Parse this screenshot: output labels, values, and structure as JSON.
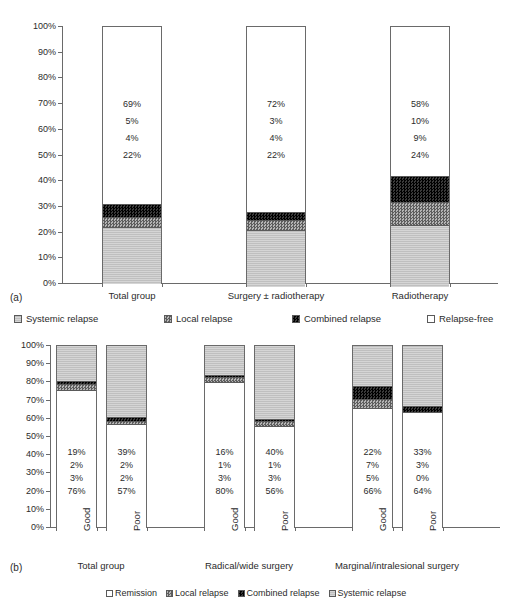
{
  "figure": {
    "panel_a_tag": "(a)",
    "panel_b_tag": "(b)"
  },
  "legend_a": {
    "items": [
      {
        "label": "Systemic relapse",
        "fill": "systemic",
        "color": "#bfbfbf"
      },
      {
        "label": "Local relapse",
        "fill": "local",
        "color": "#8a8a8a"
      },
      {
        "label": "Combined relapse",
        "fill": "combined",
        "color": "#181818"
      },
      {
        "label": "Relapse-free",
        "fill": "free",
        "color": "#ffffff"
      }
    ]
  },
  "legend_b": {
    "items": [
      {
        "label": "Remission",
        "fill": "remission",
        "color": "#ffffff"
      },
      {
        "label": "Local relapse",
        "fill": "local",
        "color": "#8a8a8a"
      },
      {
        "label": "Combined relapse",
        "fill": "combined",
        "color": "#181818"
      },
      {
        "label": "Systemic relapse",
        "fill": "systemic",
        "color": "#bfbfbf"
      }
    ]
  },
  "yticks": [
    "100%",
    "90%",
    "80%",
    "70%",
    "60%",
    "50%",
    "40%",
    "30%",
    "20%",
    "10%",
    "0%"
  ],
  "chart_data": [
    {
      "type": "bar",
      "stacked": true,
      "title": "",
      "panel": "(a)",
      "xlabel": "",
      "ylabel": "",
      "ylim": [
        0,
        100
      ],
      "ytick_values": [
        0,
        10,
        20,
        30,
        40,
        50,
        60,
        70,
        80,
        90,
        100
      ],
      "grid": false,
      "legend_position": "below-plot",
      "categories": [
        "Total group",
        "Surgery ± radiotherapy",
        "Radiotherapy"
      ],
      "series": [
        {
          "name": "Systemic relapse",
          "values": [
            22,
            22,
            24
          ]
        },
        {
          "name": "Local relapse",
          "values": [
            4,
            4,
            9
          ]
        },
        {
          "name": "Combined relapse",
          "values": [
            5,
            3,
            10
          ]
        },
        {
          "name": "Relapse-free",
          "values": [
            69,
            72,
            58
          ]
        }
      ],
      "data_labels": {
        "Total group": [
          "69%",
          "5%",
          "4%",
          "22%"
        ],
        "Surgery ± radiotherapy": [
          "72%",
          "3%",
          "4%",
          "22%"
        ],
        "Radiotherapy": [
          "58%",
          "10%",
          "9%",
          "24%"
        ]
      }
    },
    {
      "type": "bar",
      "stacked": true,
      "title": "",
      "panel": "(b)",
      "xlabel": "",
      "ylabel": "",
      "ylim": [
        0,
        100
      ],
      "ytick_values": [
        0,
        10,
        20,
        30,
        40,
        50,
        60,
        70,
        80,
        90,
        100
      ],
      "grid": false,
      "legend_position": "below-plot",
      "groups": [
        "Total group",
        "Radical/wide surgery",
        "Marginal/intralesional surgery"
      ],
      "categories": [
        "Good",
        "Poor",
        "Good",
        "Poor",
        "Good",
        "Poor"
      ],
      "series": [
        {
          "name": "Remission",
          "values": [
            76,
            57,
            80,
            56,
            66,
            64
          ]
        },
        {
          "name": "Combined relapse",
          "values": [
            3,
            2,
            3,
            3,
            5,
            0
          ]
        },
        {
          "name": "Local relapse",
          "values": [
            2,
            2,
            1,
            1,
            7,
            3
          ]
        },
        {
          "name": "Systemic relapse",
          "values": [
            19,
            39,
            16,
            40,
            22,
            33
          ]
        }
      ],
      "data_labels": {
        "Total group Good": [
          "19%",
          "2%",
          "3%",
          "76%"
        ],
        "Total group Poor": [
          "39%",
          "2%",
          "2%",
          "57%"
        ],
        "Radical/wide surgery Good": [
          "16%",
          "1%",
          "3%",
          "80%"
        ],
        "Radical/wide surgery Poor": [
          "40%",
          "1%",
          "3%",
          "56%"
        ],
        "Marginal/intralesional surgery Good": [
          "22%",
          "7%",
          "5%",
          "66%"
        ],
        "Marginal/intralesional surgery Poor": [
          "33%",
          "3%",
          "0%",
          "64%"
        ]
      }
    }
  ],
  "chart_a": {
    "bars": [
      {
        "category": "Total group",
        "x": 102,
        "w": 60,
        "labels": [
          "69%",
          "5%",
          "4%",
          "22%"
        ],
        "segments": [
          {
            "fill": "free",
            "value": 69
          },
          {
            "fill": "combined",
            "value": 5
          },
          {
            "fill": "local",
            "value": 4
          },
          {
            "fill": "systemic",
            "value": 22
          }
        ]
      },
      {
        "category": "Surgery ± radiotherapy",
        "x": 246,
        "w": 60,
        "labels": [
          "72%",
          "3%",
          "4%",
          "22%"
        ],
        "segments": [
          {
            "fill": "free",
            "value": 72
          },
          {
            "fill": "combined",
            "value": 3
          },
          {
            "fill": "local",
            "value": 4
          },
          {
            "fill": "systemic",
            "value": 22
          }
        ]
      },
      {
        "category": "Radiotherapy",
        "x": 390,
        "w": 60,
        "labels": [
          "58%",
          "10%",
          "9%",
          "24%"
        ],
        "segments": [
          {
            "fill": "free",
            "value": 58
          },
          {
            "fill": "combined",
            "value": 10
          },
          {
            "fill": "local",
            "value": 9
          },
          {
            "fill": "systemic",
            "value": 24
          }
        ]
      }
    ]
  },
  "chart_b": {
    "group_labels": [
      "Total group",
      "Radical/wide surgery",
      "Marginal/intralesional surgery"
    ],
    "bars": [
      {
        "category": "Good",
        "group": "Total group",
        "x": 56,
        "w": 41,
        "labels": [
          "19%",
          "2%",
          "3%",
          "76%"
        ],
        "segments": [
          {
            "fill": "systemic",
            "value": 19
          },
          {
            "fill": "combined",
            "value": 2
          },
          {
            "fill": "local",
            "value": 3
          },
          {
            "fill": "remission",
            "value": 76
          }
        ]
      },
      {
        "category": "Poor",
        "group": "Total group",
        "x": 106,
        "w": 41,
        "labels": [
          "39%",
          "2%",
          "2%",
          "57%"
        ],
        "segments": [
          {
            "fill": "systemic",
            "value": 39
          },
          {
            "fill": "combined",
            "value": 2
          },
          {
            "fill": "local",
            "value": 2
          },
          {
            "fill": "remission",
            "value": 57
          }
        ]
      },
      {
        "category": "Good",
        "group": "Radical/wide surgery",
        "x": 204,
        "w": 41,
        "labels": [
          "16%",
          "1%",
          "3%",
          "80%"
        ],
        "segments": [
          {
            "fill": "systemic",
            "value": 16
          },
          {
            "fill": "combined",
            "value": 1
          },
          {
            "fill": "local",
            "value": 3
          },
          {
            "fill": "remission",
            "value": 80
          }
        ]
      },
      {
        "category": "Poor",
        "group": "Radical/wide surgery",
        "x": 254,
        "w": 41,
        "labels": [
          "40%",
          "1%",
          "3%",
          "56%"
        ],
        "segments": [
          {
            "fill": "systemic",
            "value": 40
          },
          {
            "fill": "combined",
            "value": 1
          },
          {
            "fill": "local",
            "value": 3
          },
          {
            "fill": "remission",
            "value": 56
          }
        ]
      },
      {
        "category": "Good",
        "group": "Marginal/intralesional surgery",
        "x": 352,
        "w": 41,
        "labels": [
          "22%",
          "7%",
          "5%",
          "66%"
        ],
        "segments": [
          {
            "fill": "systemic",
            "value": 22
          },
          {
            "fill": "combined",
            "value": 7
          },
          {
            "fill": "local",
            "value": 5
          },
          {
            "fill": "remission",
            "value": 66
          }
        ]
      },
      {
        "category": "Poor",
        "group": "Marginal/intralesional surgery",
        "x": 402,
        "w": 41,
        "labels": [
          "33%",
          "3%",
          "0%",
          "64%"
        ],
        "segments": [
          {
            "fill": "systemic",
            "value": 33
          },
          {
            "fill": "combined",
            "value": 3
          },
          {
            "fill": "local",
            "value": 0
          },
          {
            "fill": "remission",
            "value": 64
          }
        ]
      }
    ]
  }
}
